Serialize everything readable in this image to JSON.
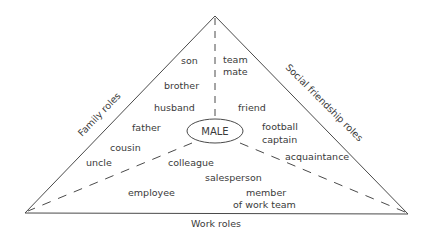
{
  "diagram": {
    "type": "role-triangle",
    "center": {
      "label": "MALE"
    },
    "edges": {
      "left": {
        "label": "Family roles"
      },
      "right": {
        "label": "Social friendship roles"
      },
      "bottom": {
        "label": "Work roles"
      }
    },
    "family_roles": [
      "son",
      "brother",
      "husband",
      "father",
      "cousin",
      "uncle"
    ],
    "social_roles": [
      "team",
      "mate",
      "friend",
      "football",
      "captain",
      "acquaintance"
    ],
    "work_roles": [
      "colleague",
      "salesperson",
      "employee",
      "member",
      "of work team"
    ],
    "colors": {
      "line": "#4a4a4a",
      "text": "#3a3a3a",
      "background": "#ffffff"
    }
  }
}
